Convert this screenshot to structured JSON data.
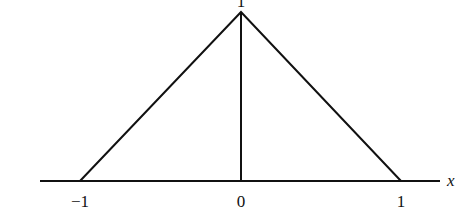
{
  "diagram": {
    "axis_label": "x",
    "tick_labels": [
      "−1",
      "0",
      "1"
    ],
    "peak_label": "1",
    "points": [
      [
        -1,
        0
      ],
      [
        0,
        1
      ],
      [
        1,
        0
      ]
    ],
    "stroke_color": "#111111"
  }
}
